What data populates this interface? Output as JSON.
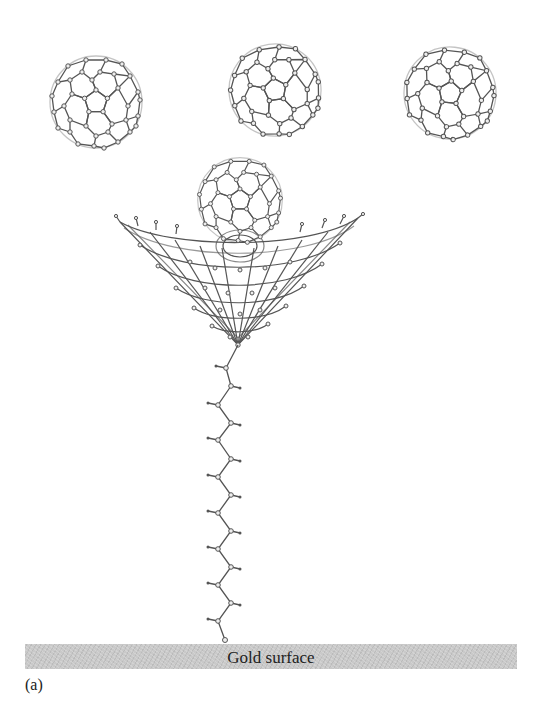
{
  "figure": {
    "panel_label": "(a)",
    "surface_label": "Gold surface",
    "components": [
      {
        "name": "fullerene-1",
        "type": "C60 buckyball",
        "position": "top-left"
      },
      {
        "name": "fullerene-2",
        "type": "C60 buckyball",
        "position": "top-center"
      },
      {
        "name": "fullerene-3",
        "type": "C60 buckyball",
        "position": "top-right"
      },
      {
        "name": "cone-host",
        "type": "conical carbon nanocone receptor with captured C60"
      },
      {
        "name": "alkyl-chain",
        "type": "zigzag alkyl thiol tether"
      },
      {
        "name": "gold-surface",
        "type": "substrate"
      }
    ],
    "colors": {
      "line": "#555555",
      "atom_fill": "#e8e8e8",
      "surface": "#c9c9c9"
    }
  }
}
